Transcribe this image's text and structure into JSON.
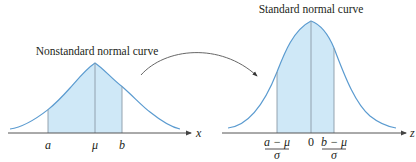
{
  "colors": {
    "curve": "#5b9bd0",
    "fill": "#cfe8f7",
    "axis": "#555555",
    "divider": "#8a9aa6",
    "arrow": "#555555",
    "text": "#231f20"
  },
  "left_panel": {
    "title": "Nonstandard normal curve",
    "axis_label": "x",
    "ticks": [
      {
        "label": "a"
      },
      {
        "label": "μ"
      },
      {
        "label": "b"
      }
    ]
  },
  "right_panel": {
    "title": "Standard normal curve",
    "axis_label": "z",
    "ticks": [
      {
        "numerator": "a − μ",
        "denominator": "σ"
      },
      {
        "label": "0"
      },
      {
        "numerator": "b − μ",
        "denominator": "σ"
      }
    ]
  },
  "connector": {
    "icon": "curved-arrow-icon",
    "meaning": "transform"
  }
}
